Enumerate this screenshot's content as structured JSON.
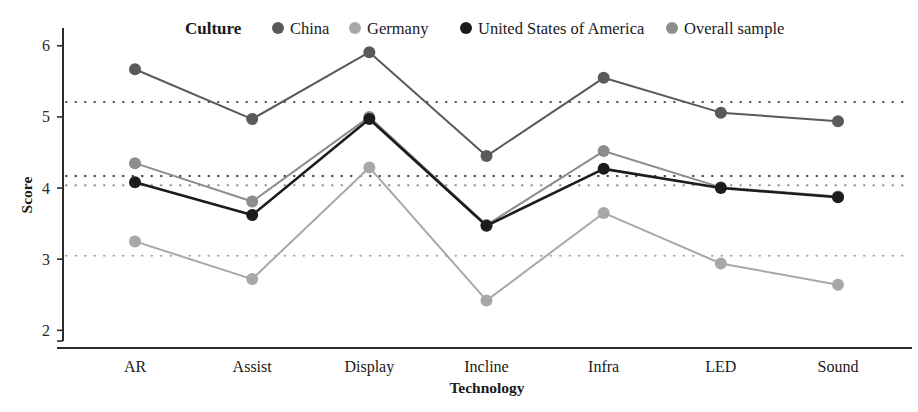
{
  "legend": {
    "title": "Culture",
    "items": [
      {
        "label": "China",
        "color": "#5a5a5a"
      },
      {
        "label": "Germany",
        "color": "#a8a8a8"
      },
      {
        "label": "United States of America",
        "color": "#1c1c1c"
      },
      {
        "label": "Overall sample",
        "color": "#8d8d8d"
      }
    ]
  },
  "chart_data": {
    "type": "line",
    "title": "",
    "xlabel": "Technology",
    "ylabel": "Score",
    "categories": [
      "AR",
      "Assist",
      "Display",
      "Incline",
      "Infra",
      "LED",
      "Sound"
    ],
    "ylim": [
      1.85,
      6.25
    ],
    "yticks": [
      2,
      3,
      4,
      5,
      6
    ],
    "ytick_labels": [
      "2",
      "3",
      "4",
      "5",
      "6"
    ],
    "grid": false,
    "legend_position": "top",
    "series": [
      {
        "name": "China",
        "color": "#5a5a5a",
        "values": [
          5.67,
          4.97,
          5.91,
          4.45,
          5.55,
          5.06,
          4.94
        ]
      },
      {
        "name": "Germany",
        "color": "#a8a8a8",
        "values": [
          3.25,
          2.72,
          4.29,
          2.42,
          3.65,
          2.94,
          2.64
        ]
      },
      {
        "name": "United States of America",
        "color": "#1c1c1c",
        "values": [
          4.08,
          3.62,
          4.97,
          3.47,
          4.27,
          4.0,
          3.87
        ]
      },
      {
        "name": "Overall sample",
        "color": "#8d8d8d",
        "values": [
          4.35,
          3.81,
          5.0,
          3.48,
          4.52,
          4.01,
          3.88
        ]
      }
    ],
    "reference_lines": [
      {
        "name": "china-mean",
        "value": 5.21,
        "color": "#4f4f4f"
      },
      {
        "name": "overall-mean",
        "value": 4.17,
        "color": "#3a3a3a"
      },
      {
        "name": "usa-mean",
        "value": 4.04,
        "color": "#8d8d8d"
      },
      {
        "name": "germany-mean",
        "value": 3.05,
        "color": "#a8a8a8"
      }
    ]
  }
}
